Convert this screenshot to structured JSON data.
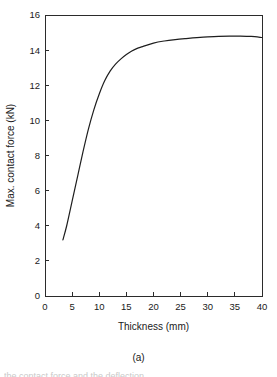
{
  "figure": {
    "subfigure_label": "(a)",
    "caption_partial": "the contact force and the deflection"
  },
  "chart_data": {
    "type": "line",
    "title": "",
    "xlabel": "Thickness (mm)",
    "ylabel": "Max. contact force (kN)",
    "xlim": [
      0,
      40
    ],
    "ylim": [
      0,
      16
    ],
    "xticks": [
      0,
      5,
      10,
      15,
      20,
      25,
      30,
      35,
      40
    ],
    "yticks": [
      0,
      2,
      4,
      6,
      8,
      10,
      12,
      14,
      16
    ],
    "xtick_labels": [
      "0",
      "5",
      "10",
      "15",
      "20",
      "25",
      "30",
      "35",
      "40"
    ],
    "ytick_labels": [
      "0",
      "2",
      "4",
      "6",
      "8",
      "10",
      "12",
      "14",
      "16"
    ],
    "grid": false,
    "legend": "none",
    "series": [
      {
        "name": "Max. contact force",
        "color": "#1e1e1e",
        "x": [
          3.3,
          4.0,
          5.0,
          6.0,
          7.0,
          8.0,
          9.0,
          10.0,
          11.0,
          12.0,
          13.0,
          14.0,
          15.0,
          16.0,
          17.0,
          18.0,
          20.0,
          22.0,
          24.0,
          26.0,
          28.0,
          30.0,
          32.0,
          34.0,
          36.0,
          38.0,
          40.0
        ],
        "y": [
          3.2,
          4.0,
          5.4,
          6.8,
          8.2,
          9.5,
          10.6,
          11.5,
          12.25,
          12.8,
          13.2,
          13.5,
          13.75,
          13.95,
          14.1,
          14.2,
          14.4,
          14.52,
          14.6,
          14.66,
          14.71,
          14.75,
          14.78,
          14.8,
          14.8,
          14.78,
          14.72
        ]
      }
    ]
  },
  "plot_box": {
    "left": 45,
    "right": 262,
    "top": 15,
    "bottom": 296
  }
}
